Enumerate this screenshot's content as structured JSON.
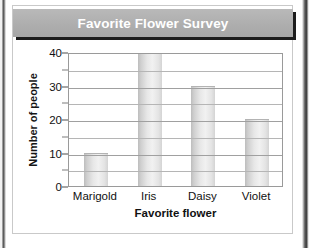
{
  "figure": {
    "title": "Favorite Flower Survey",
    "title_banner_color": "#b0b0b0",
    "title_text_color": "#ffffff",
    "card_background": "#ffffff",
    "bar_color": "#dcdcdc",
    "grid_color": "#b5b5b5",
    "axis_color": "#9a9a9a"
  },
  "chart_data": {
    "type": "bar",
    "title": "Favorite Flower Survey",
    "xlabel": "Favorite flower",
    "ylabel": "Number of people",
    "categories": [
      "Marigold",
      "Iris",
      "Daisy",
      "Violet"
    ],
    "values": [
      10,
      40,
      30,
      20
    ],
    "ylim": [
      0,
      40
    ],
    "ytick_labels": [
      "0",
      "10",
      "20",
      "30",
      "40"
    ],
    "ytick_values": [
      0,
      10,
      20,
      30,
      40
    ],
    "gridline_values": [
      0,
      5,
      10,
      15,
      20,
      25,
      30,
      35,
      40
    ],
    "grid": true,
    "legend": false,
    "orientation": "vertical"
  }
}
